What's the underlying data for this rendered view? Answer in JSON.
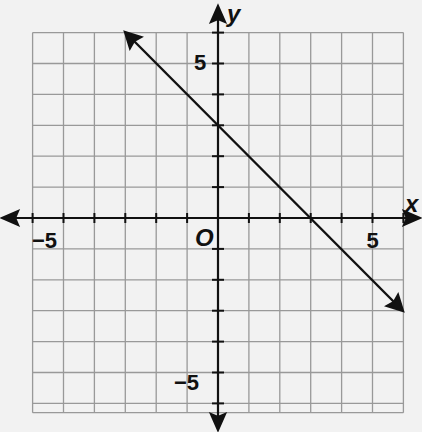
{
  "chart_data": {
    "type": "line",
    "title": "",
    "xlabel": "x",
    "ylabel": "y",
    "origin_label": "O",
    "xlim": [
      -6,
      6
    ],
    "ylim": [
      -6,
      6
    ],
    "grid": true,
    "x_tick_labels": [
      {
        "value": -5,
        "label": "−5"
      },
      {
        "value": 5,
        "label": "5"
      }
    ],
    "y_tick_labels": [
      {
        "value": 5,
        "label": "5"
      },
      {
        "value": -5,
        "label": "−5"
      }
    ],
    "series": [
      {
        "name": "line",
        "equation": "y = -x + 3",
        "slope": -1,
        "y_intercept": 3,
        "x_intercept": 3,
        "x": [
          -3,
          6
        ],
        "y": [
          6,
          -3
        ],
        "arrows_both_ends": true
      }
    ]
  },
  "labels": {
    "x_axis": "x",
    "y_axis": "y",
    "origin": "O",
    "x_neg5": "−5",
    "x_pos5": "5",
    "y_pos5": "5",
    "y_neg5": "−5"
  }
}
